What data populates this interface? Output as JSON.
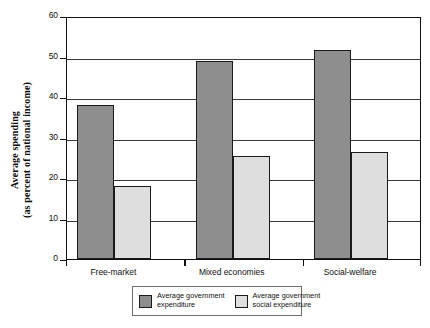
{
  "chart_data": {
    "type": "bar",
    "title": "",
    "xlabel": "",
    "ylabel_line1": "Average spending",
    "ylabel_line2": "(as percent of national income)",
    "categories": [
      "Free-market",
      "Mixed economies",
      "Social-welfare"
    ],
    "series": [
      {
        "name": "Average government expenditure",
        "color": "#8e8e8e",
        "values": [
          38,
          48.9,
          51.6
        ]
      },
      {
        "name": "Average government social expenditure",
        "color": "#dedede",
        "values": [
          18,
          25.4,
          26.4
        ]
      }
    ],
    "ylim": [
      0,
      60
    ],
    "yticks": [
      0,
      10,
      20,
      30,
      40,
      50,
      60
    ],
    "ytick_labels": [
      "0",
      "10",
      "20",
      "30",
      "40",
      "50",
      "60"
    ],
    "grid": true,
    "grid_axis": "y",
    "legend_position": "bottom",
    "legend": [
      {
        "label_line1": "Average government",
        "label_line2": "expenditure",
        "swatch": "dark"
      },
      {
        "label_line1": "Average government",
        "label_line2": "social expenditure",
        "swatch": "light"
      }
    ]
  }
}
